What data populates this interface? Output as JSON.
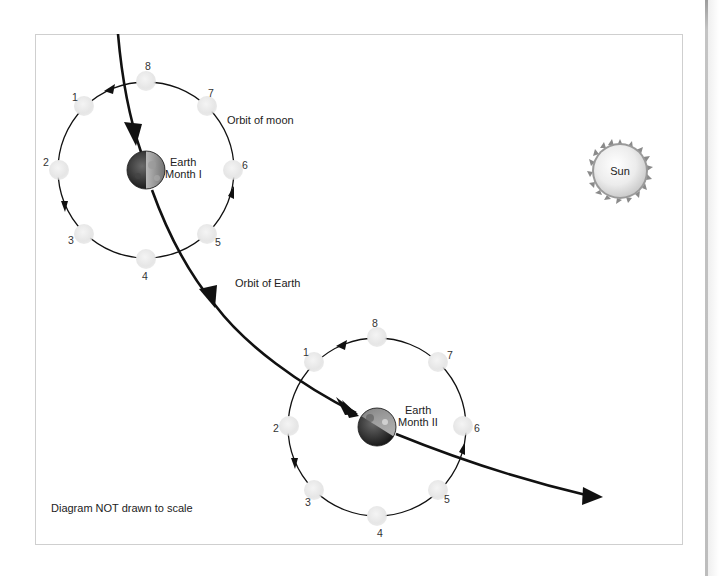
{
  "diagram": {
    "labels": {
      "orbit_of_moon": "Orbit of moon",
      "orbit_of_earth": "Orbit of Earth",
      "sun": "Sun",
      "footnote": "Diagram NOT drawn to scale"
    },
    "systems": [
      {
        "id": "month-1",
        "earth_label_line1": "Earth",
        "earth_label_line2": "Month I",
        "moon_positions": [
          "1",
          "2",
          "3",
          "4",
          "5",
          "6",
          "7",
          "8"
        ]
      },
      {
        "id": "month-2",
        "earth_label_line1": "Earth",
        "earth_label_line2": "Month II",
        "moon_positions": [
          "1",
          "2",
          "3",
          "4",
          "5",
          "6",
          "7",
          "8"
        ]
      }
    ],
    "colors": {
      "line": "#111111",
      "moon_fill": "#e6e6e6",
      "frame_border": "#cfcfcf",
      "sun_fill": "#e9e9e9",
      "sun_corona": "#8a8a8a"
    }
  }
}
